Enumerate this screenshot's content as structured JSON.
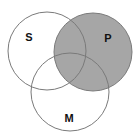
{
  "diagram": {
    "type": "venn",
    "circles": [
      {
        "id": "S",
        "label": "S",
        "cx": 47,
        "cy": 51,
        "r": 39,
        "shaded": false,
        "label_x": 29,
        "label_y": 41
      },
      {
        "id": "P",
        "label": "P",
        "cx": 93,
        "cy": 52,
        "r": 39,
        "shaded": true,
        "label_x": 108,
        "label_y": 42
      },
      {
        "id": "M",
        "label": "M",
        "cx": 70,
        "cy": 92,
        "r": 39,
        "shaded": false,
        "label_x": 69,
        "label_y": 122
      }
    ],
    "colors": {
      "shade": "#a6a6a6",
      "stroke": "#7a7a7a",
      "background": "#ffffff",
      "label": "#111111"
    }
  }
}
